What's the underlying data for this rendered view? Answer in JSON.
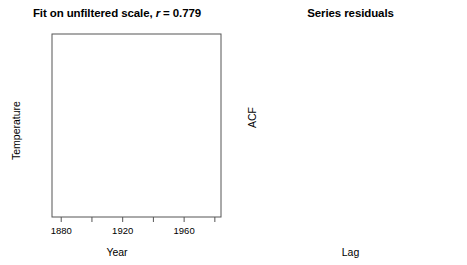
{
  "figure": {
    "width": 467,
    "height": 265,
    "background": "#ffffff",
    "foreground": "#000000"
  },
  "panels": {
    "left": {
      "title_prefix": "Fit on unfiltered scale, ",
      "title_italic": "r",
      "title_suffix": " = 0.779",
      "title_full": "Fit on unfiltered scale, r = 0.779",
      "xlabel": "Year",
      "ylabel": "Temperature"
    },
    "right": {
      "title_full": "Series residuals",
      "xlabel": "Lag",
      "ylabel": "ACF"
    }
  },
  "chart_data": [
    {
      "type": "scatter",
      "id": "fit-unfiltered-scale",
      "title": "Fit on unfiltered scale, r = 0.779",
      "xlabel": "Year",
      "ylabel": "Temperature",
      "correlation_r": 0.779,
      "xlim": [
        1874,
        1984
      ],
      "ylim": [
        -0.52,
        0.33
      ],
      "xticks": [
        1880,
        1900,
        1920,
        1940,
        1960,
        1980
      ],
      "xticklabels": [
        "1880",
        "",
        "1920",
        "",
        "1960",
        ""
      ],
      "yticks": [
        -0.4,
        -0.2,
        0.0,
        0.2
      ],
      "yticklabels": [
        "-0.4",
        "-0.2",
        "0.0",
        "0.2"
      ],
      "grid": false,
      "legend": null,
      "marker": "open-circle",
      "regression_line": {
        "x": [
          1876,
          1981
        ],
        "y": [
          -0.372,
          0.215
        ]
      },
      "points": [
        [
          1877,
          -0.345
        ],
        [
          1878,
          -0.3
        ],
        [
          1879,
          -0.34
        ],
        [
          1880,
          -0.35
        ],
        [
          1881,
          -0.33
        ],
        [
          1881,
          -0.365
        ],
        [
          1882,
          -0.355
        ],
        [
          1883,
          -0.395
        ],
        [
          1884,
          -0.425
        ],
        [
          1885,
          -0.43
        ],
        [
          1886,
          -0.455
        ],
        [
          1887,
          -0.47
        ],
        [
          1888,
          -0.44
        ],
        [
          1889,
          -0.395
        ],
        [
          1890,
          -0.48
        ],
        [
          1891,
          -0.46
        ],
        [
          1892,
          -0.5
        ],
        [
          1893,
          -0.505
        ],
        [
          1894,
          -0.455
        ],
        [
          1895,
          -0.43
        ],
        [
          1896,
          -0.33
        ],
        [
          1897,
          -0.32
        ],
        [
          1898,
          -0.395
        ],
        [
          1899,
          -0.36
        ],
        [
          1900,
          -0.3
        ],
        [
          1901,
          -0.32
        ],
        [
          1902,
          -0.37
        ],
        [
          1903,
          -0.415
        ],
        [
          1904,
          -0.455
        ],
        [
          1905,
          -0.37
        ],
        [
          1906,
          -0.33
        ],
        [
          1907,
          -0.43
        ],
        [
          1908,
          -0.44
        ],
        [
          1909,
          -0.445
        ],
        [
          1910,
          -0.43
        ],
        [
          1911,
          -0.425
        ],
        [
          1912,
          -0.38
        ],
        [
          1913,
          -0.37
        ],
        [
          1914,
          -0.255
        ],
        [
          1915,
          -0.215
        ],
        [
          1916,
          -0.33
        ],
        [
          1917,
          -0.4
        ],
        [
          1918,
          -0.33
        ],
        [
          1919,
          -0.275
        ],
        [
          1920,
          -0.25
        ],
        [
          1921,
          -0.205
        ],
        [
          1922,
          -0.27
        ],
        [
          1923,
          -0.255
        ],
        [
          1924,
          -0.25
        ],
        [
          1925,
          -0.215
        ],
        [
          1926,
          -0.12
        ],
        [
          1927,
          -0.185
        ],
        [
          1928,
          -0.175
        ],
        [
          1929,
          -0.26
        ],
        [
          1930,
          -0.13
        ],
        [
          1931,
          -0.1
        ],
        [
          1932,
          -0.125
        ],
        [
          1933,
          -0.195
        ],
        [
          1934,
          -0.12
        ],
        [
          1935,
          -0.165
        ],
        [
          1936,
          -0.14
        ],
        [
          1937,
          -0.04
        ],
        [
          1938,
          -0.01
        ],
        [
          1939,
          -0.03
        ],
        [
          1940,
          0.03
        ],
        [
          1941,
          0.05
        ],
        [
          1942,
          0.02
        ],
        [
          1943,
          0.025
        ],
        [
          1944,
          0.09
        ],
        [
          1945,
          0.02
        ],
        [
          1946,
          -0.055
        ],
        [
          1947,
          -0.04
        ],
        [
          1948,
          -0.065
        ],
        [
          1949,
          -0.08
        ],
        [
          1950,
          -0.13
        ],
        [
          1951,
          -0.04
        ],
        [
          1952,
          0.01
        ],
        [
          1953,
          0.065
        ],
        [
          1954,
          -0.06
        ],
        [
          1955,
          -0.095
        ],
        [
          1956,
          -0.145
        ],
        [
          1957,
          0.015
        ],
        [
          1958,
          0.04
        ],
        [
          1959,
          0.0
        ],
        [
          1960,
          -0.025
        ],
        [
          1961,
          0.035
        ],
        [
          1962,
          0.02
        ],
        [
          1963,
          0.03
        ],
        [
          1964,
          -0.11
        ],
        [
          1965,
          -0.08
        ],
        [
          1966,
          -0.04
        ],
        [
          1967,
          -0.03
        ],
        [
          1968,
          -0.05
        ],
        [
          1969,
          0.035
        ],
        [
          1970,
          0.01
        ],
        [
          1971,
          -0.065
        ],
        [
          1972,
          -0.035
        ],
        [
          1973,
          0.075
        ],
        [
          1974,
          -0.055
        ],
        [
          1975,
          -0.04
        ],
        [
          1976,
          -0.095
        ],
        [
          1977,
          0.075
        ],
        [
          1978,
          0.035
        ],
        [
          1979,
          0.085
        ],
        [
          1980,
          0.14
        ],
        [
          1981,
          0.18
        ],
        [
          1982,
          0.055
        ],
        [
          1983,
          0.145
        ],
        [
          1890,
          -0.01
        ],
        [
          1896,
          0.005
        ],
        [
          1901,
          -0.105
        ],
        [
          1905,
          -0.11
        ],
        [
          1908,
          -0.145
        ],
        [
          1913,
          -0.14
        ],
        [
          1917,
          -0.165
        ],
        [
          1921,
          -0.11
        ],
        [
          1925,
          -0.035
        ],
        [
          1929,
          -0.055
        ],
        [
          1933,
          0.04
        ],
        [
          1936,
          0.075
        ],
        [
          1939,
          0.1
        ],
        [
          1942,
          0.115
        ],
        [
          1945,
          0.09
        ],
        [
          1948,
          0.1
        ],
        [
          1951,
          0.105
        ],
        [
          1954,
          0.125
        ],
        [
          1957,
          0.11
        ],
        [
          1960,
          0.115
        ],
        [
          1963,
          0.14
        ],
        [
          1966,
          0.095
        ],
        [
          1969,
          0.15
        ],
        [
          1972,
          0.125
        ],
        [
          1975,
          0.105
        ],
        [
          1978,
          0.22
        ],
        [
          1980,
          0.26
        ],
        [
          1982,
          0.29
        ],
        [
          1983,
          0.3
        ],
        [
          1979,
          0.16
        ],
        [
          1976,
          0.155
        ],
        [
          1973,
          0.06
        ],
        [
          1970,
          0.075
        ],
        [
          1967,
          0.055
        ],
        [
          1964,
          0.045
        ],
        [
          1961,
          0.07
        ],
        [
          1958,
          0.085
        ],
        [
          1955,
          0.07
        ],
        [
          1952,
          0.06
        ],
        [
          1949,
          0.045
        ],
        [
          1946,
          0.05
        ],
        [
          1943,
          0.055
        ],
        [
          1940,
          0.07
        ],
        [
          1937,
          0.04
        ],
        [
          1934,
          0.02
        ],
        [
          1931,
          0.03
        ],
        [
          1928,
          -0.06
        ],
        [
          1924,
          -0.095
        ],
        [
          1919,
          -0.145
        ],
        [
          1915,
          -0.195
        ],
        [
          1911,
          -0.215
        ],
        [
          1907,
          -0.25
        ],
        [
          1903,
          -0.285
        ],
        [
          1899,
          -0.3
        ],
        [
          1893,
          -0.33
        ],
        [
          1888,
          -0.36
        ]
      ]
    },
    {
      "type": "bar",
      "id": "series-residuals-acf",
      "subtype": "acf-correlogram",
      "title": "Series residuals",
      "xlabel": "Lag",
      "ylabel": "ACF",
      "xlim": [
        -0.6,
        21.0
      ],
      "ylim": [
        -0.28,
        1.03
      ],
      "xticks": [
        0,
        5,
        10,
        15,
        20
      ],
      "xticklabels": [
        "0",
        "5",
        "10",
        "15",
        "20"
      ],
      "yticks": [
        -0.2,
        0.0,
        0.2,
        0.4,
        0.6,
        0.8,
        1.0
      ],
      "yticklabels": [
        "-0.2",
        "0.0",
        "0.2",
        "0.4",
        "0.6",
        "0.8",
        "1.0"
      ],
      "grid": false,
      "legend": null,
      "zero_line": 0.0,
      "confidence_bands": {
        "style": "dashed",
        "upper": 0.205,
        "lower": -0.205
      },
      "categories": [
        0,
        1,
        2,
        3,
        4,
        5,
        6,
        7,
        8,
        9,
        10,
        11,
        12,
        13,
        14,
        15,
        16,
        17,
        18,
        19,
        20
      ],
      "values": [
        1.0,
        0.445,
        0.145,
        0.105,
        0.2,
        0.08,
        0.115,
        -0.02,
        -0.015,
        -0.03,
        0.055,
        -0.015,
        -0.06,
        -0.085,
        0.015,
        -0.035,
        -0.065,
        -0.065,
        -0.02,
        -0.01,
        0.06
      ]
    }
  ]
}
